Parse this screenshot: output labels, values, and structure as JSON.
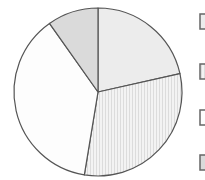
{
  "chart_data": {
    "type": "pie",
    "title": "",
    "start_angle_deg": 0,
    "direction": "clockwise",
    "center": [
      98,
      92
    ],
    "radius": 84,
    "slices": [
      {
        "value": 21.5,
        "fill": "#ececec",
        "pattern": "none"
      },
      {
        "value": 31.1,
        "fill": "#f3f3f3",
        "pattern": "vertical-stripes",
        "stripe_color": "#dcdcdc"
      },
      {
        "value": 37.6,
        "fill": "#fdfdfd",
        "pattern": "none"
      },
      {
        "value": 9.8,
        "fill": "#dadada",
        "pattern": "none"
      }
    ],
    "stroke_color": "#555555",
    "legend": {
      "position": "right",
      "entries": [
        {
          "label": "",
          "y": 14
        },
        {
          "label": "",
          "y": 64
        },
        {
          "label": "",
          "y": 110
        },
        {
          "label": "",
          "y": 155
        }
      ],
      "box_x": 200,
      "box_w": 12,
      "box_h": 15,
      "box_stroke": "#666666"
    }
  }
}
